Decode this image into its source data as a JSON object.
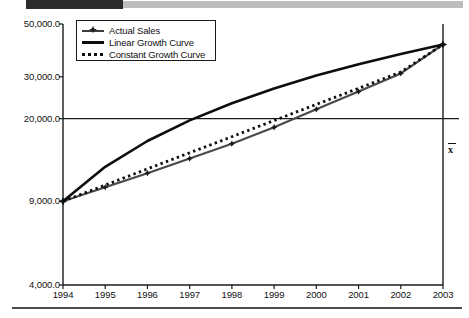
{
  "figure": {
    "decorations": {
      "top_bar_dark": "#2b2b2b",
      "top_bar_light": "#bdbdbd",
      "bottom_rule": "#4a4a4a"
    }
  },
  "chart_data": {
    "type": "line",
    "title": "",
    "xlabel": "",
    "ylabel": "",
    "yscale": "log",
    "ylim": [
      4000,
      50000
    ],
    "ytick_labels": [
      "50,000.0",
      "30,000.0",
      "20,000.0",
      "9,000.0",
      "4,000.0"
    ],
    "ytick_values": [
      50000,
      30000,
      20000,
      9000,
      4000
    ],
    "grid": false,
    "legend_position": "upper left",
    "categories": [
      "1994",
      "1995",
      "1996",
      "1997",
      "1998",
      "1999",
      "2000",
      "2001",
      "2002",
      "2003"
    ],
    "x": [
      1994,
      1995,
      1996,
      1997,
      1998,
      1999,
      2000,
      2001,
      2002,
      2003
    ],
    "series": [
      {
        "name": "Actual Sales",
        "style": "line-marker",
        "color": "#4a4a4a",
        "marker": "diamond",
        "values": [
          9000,
          10300,
          11800,
          13600,
          15700,
          18400,
          21900,
          26000,
          31000,
          41000
        ]
      },
      {
        "name": "Linear Growth Curve",
        "style": "solid-thick",
        "color": "#0d0d0d",
        "values": [
          9000,
          12556,
          16111,
          19667,
          23222,
          26778,
          30333,
          33889,
          37444,
          41000
        ]
      },
      {
        "name": "Constant Growth Curve",
        "style": "dotted",
        "color": "#0d0d0d",
        "values": [
          9000,
          10520,
          12298,
          14375,
          16804,
          19643,
          22962,
          26842,
          31379,
          41000
        ]
      }
    ],
    "annotations": [
      {
        "name": "mean-line",
        "type": "hline",
        "value": 20000,
        "label": "x̄",
        "label_position": "right"
      }
    ]
  },
  "legend": {
    "items": [
      {
        "label": "Actual Sales",
        "key": "line-diamond-marker"
      },
      {
        "label": "Linear Growth Curve",
        "key": "solid-thick-line"
      },
      {
        "label": "Constant Growth Curve",
        "key": "dotted-line"
      }
    ]
  }
}
